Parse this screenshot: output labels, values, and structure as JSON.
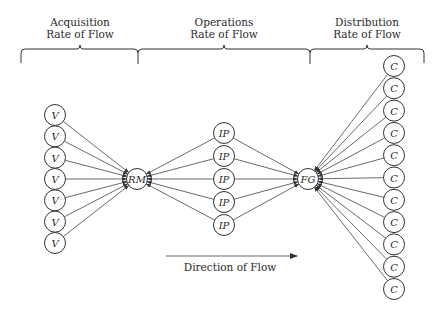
{
  "diagram": {
    "sections": [
      {
        "id": "acquisition",
        "title_line1": "Acquisition",
        "title_line2": "Rate of Flow"
      },
      {
        "id": "operations",
        "title_line1": "Operations",
        "title_line2": "Rate of Flow"
      },
      {
        "id": "distribution",
        "title_line1": "Distribution",
        "title_line2": "Rate of Flow"
      }
    ],
    "nodes": {
      "vendors": {
        "label": "V",
        "count": 7
      },
      "raw_materials": {
        "label": "RM"
      },
      "in_process": {
        "label": "IP",
        "count": 5
      },
      "finished_goods": {
        "label": "FG"
      },
      "customers": {
        "label": "C",
        "count": 11
      }
    },
    "direction_label": "Direction of Flow"
  }
}
